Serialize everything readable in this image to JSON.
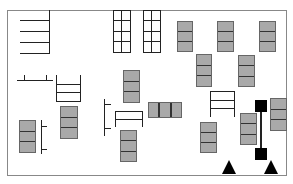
{
  "diagram": {
    "title": "",
    "colors": {
      "shelf_fill": "#a9a9a9",
      "line": "#222222",
      "marker": "#000000",
      "frame": "#888888"
    },
    "frame": {
      "x": 7,
      "y": 10,
      "w": 280,
      "h": 166
    },
    "combs": [
      {
        "name": "top-left-comb",
        "x": 20,
        "y": 10,
        "w": 30,
        "teeth": 4
      }
    ],
    "grids": [
      {
        "name": "grid-rack-1",
        "x": 113,
        "y": 10,
        "w": 18,
        "h": 43,
        "cols": 2,
        "rows": 4
      },
      {
        "name": "grid-rack-2",
        "x": 143,
        "y": 10,
        "w": 18,
        "h": 43,
        "cols": 2,
        "rows": 4
      }
    ],
    "vertical_stacks": [
      {
        "x": 177,
        "y": 21,
        "w": 16,
        "h": 31,
        "cells": 3
      },
      {
        "x": 217,
        "y": 21,
        "w": 17,
        "h": 31,
        "cells": 3
      },
      {
        "x": 259,
        "y": 21,
        "w": 17,
        "h": 31,
        "cells": 3
      },
      {
        "x": 196,
        "y": 54,
        "w": 16,
        "h": 33,
        "cells": 3
      },
      {
        "x": 238,
        "y": 55,
        "w": 17,
        "h": 32,
        "cells": 3
      },
      {
        "x": 123,
        "y": 70,
        "w": 17,
        "h": 33,
        "cells": 3
      },
      {
        "x": 60,
        "y": 106,
        "w": 18,
        "h": 33,
        "cells": 3
      },
      {
        "x": 19,
        "y": 120,
        "w": 17,
        "h": 33,
        "cells": 3
      },
      {
        "x": 120,
        "y": 130,
        "w": 17,
        "h": 32,
        "cells": 3
      },
      {
        "x": 200,
        "y": 122,
        "w": 17,
        "h": 31,
        "cells": 3
      },
      {
        "x": 240,
        "y": 113,
        "w": 17,
        "h": 32,
        "cells": 3
      },
      {
        "x": 270,
        "y": 98,
        "w": 17,
        "h": 33,
        "cells": 3
      }
    ],
    "horizontal_stacks": [
      {
        "x": 148,
        "y": 102,
        "w": 34,
        "h": 16,
        "cells": 3
      }
    ],
    "markers": {
      "squares": [
        {
          "x": 255,
          "y": 100,
          "w": 12,
          "h": 12
        },
        {
          "x": 255,
          "y": 148,
          "w": 12,
          "h": 12
        }
      ],
      "triangles": [
        {
          "x": 222,
          "y": 160
        },
        {
          "x": 264,
          "y": 160
        }
      ]
    },
    "legend": []
  }
}
